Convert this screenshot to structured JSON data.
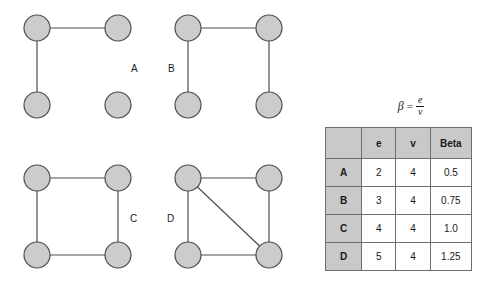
{
  "figure": {
    "formula": {
      "symbol": "β",
      "equals": "=",
      "numerator": "e",
      "denominator": "v"
    },
    "graphs": [
      {
        "id": "A",
        "label": "A",
        "edge_count": 2,
        "vertex_count": 4,
        "beta": 0.5,
        "nodes": [
          {
            "id": "tl",
            "cx": 22,
            "cy": 18
          },
          {
            "id": "tr",
            "cx": 103,
            "cy": 18
          },
          {
            "id": "bl",
            "cx": 22,
            "cy": 95
          },
          {
            "id": "br",
            "cx": 103,
            "cy": 95
          }
        ],
        "edges": [
          {
            "from": "tl",
            "to": "tr"
          },
          {
            "from": "tl",
            "to": "bl"
          }
        ]
      },
      {
        "id": "B",
        "label": "B",
        "edge_count": 3,
        "vertex_count": 4,
        "beta": 0.75,
        "nodes": [
          {
            "id": "tl",
            "cx": 22,
            "cy": 18
          },
          {
            "id": "tr",
            "cx": 103,
            "cy": 18
          },
          {
            "id": "bl",
            "cx": 22,
            "cy": 95
          },
          {
            "id": "br",
            "cx": 103,
            "cy": 95
          }
        ],
        "edges": [
          {
            "from": "tl",
            "to": "tr"
          },
          {
            "from": "tl",
            "to": "bl"
          },
          {
            "from": "tr",
            "to": "br"
          }
        ]
      },
      {
        "id": "C",
        "label": "C",
        "edge_count": 4,
        "vertex_count": 4,
        "beta": 1.0,
        "nodes": [
          {
            "id": "tl",
            "cx": 22,
            "cy": 18
          },
          {
            "id": "tr",
            "cx": 103,
            "cy": 18
          },
          {
            "id": "bl",
            "cx": 22,
            "cy": 95
          },
          {
            "id": "br",
            "cx": 103,
            "cy": 95
          }
        ],
        "edges": [
          {
            "from": "tl",
            "to": "tr"
          },
          {
            "from": "tl",
            "to": "bl"
          },
          {
            "from": "tr",
            "to": "br"
          },
          {
            "from": "bl",
            "to": "br"
          }
        ]
      },
      {
        "id": "D",
        "label": "D",
        "edge_count": 5,
        "vertex_count": 4,
        "beta": 1.25,
        "nodes": [
          {
            "id": "tl",
            "cx": 22,
            "cy": 18
          },
          {
            "id": "tr",
            "cx": 103,
            "cy": 18
          },
          {
            "id": "bl",
            "cx": 22,
            "cy": 95
          },
          {
            "id": "br",
            "cx": 103,
            "cy": 95
          }
        ],
        "edges": [
          {
            "from": "tl",
            "to": "tr"
          },
          {
            "from": "tl",
            "to": "bl"
          },
          {
            "from": "tr",
            "to": "br"
          },
          {
            "from": "bl",
            "to": "br"
          },
          {
            "from": "tl",
            "to": "br"
          }
        ]
      }
    ],
    "node_style": {
      "radius": 13,
      "fill": "#cccccc",
      "stroke": "#4d4d4d",
      "stroke_width": 1.2
    },
    "edge_style": {
      "stroke": "#4d4d4d",
      "stroke_width": 1.2
    }
  },
  "table": {
    "headers": [
      "",
      "e",
      "v",
      "Beta"
    ],
    "rows": [
      {
        "label": "A",
        "e": "2",
        "v": "4",
        "beta": "0.5"
      },
      {
        "label": "B",
        "e": "3",
        "v": "4",
        "beta": "0.75"
      },
      {
        "label": "C",
        "e": "4",
        "v": "4",
        "beta": "1.0"
      },
      {
        "label": "D",
        "e": "5",
        "v": "4",
        "beta": "1.25"
      }
    ],
    "header_bg": "#c9c9c9",
    "border_color": "#6e6e6e"
  },
  "chart_data": {
    "type": "table",
    "categories": [
      "A",
      "B",
      "C",
      "D"
    ],
    "series": [
      {
        "name": "e",
        "values": [
          2,
          3,
          4,
          5
        ]
      },
      {
        "name": "v",
        "values": [
          4,
          4,
          4,
          4
        ]
      },
      {
        "name": "Beta",
        "values": [
          0.5,
          0.75,
          1.0,
          1.25
        ]
      }
    ]
  }
}
